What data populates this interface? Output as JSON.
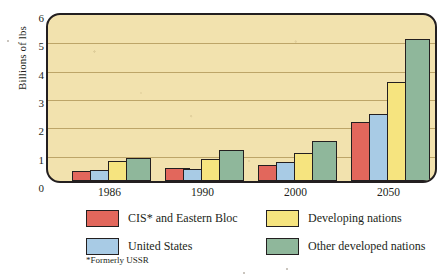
{
  "chart_data": {
    "type": "bar",
    "title": "",
    "xlabel": "",
    "ylabel": "Billions of lbs",
    "categories": [
      "1986",
      "1990",
      "2000",
      "2050"
    ],
    "ylim": [
      0,
      6
    ],
    "yticks": [
      "0",
      "1",
      "2",
      "3",
      "4",
      "5",
      "6"
    ],
    "grid": true,
    "legend_position": "below",
    "series": [
      {
        "name": "CIS* and Eastern Bloc",
        "color": "#e2675c",
        "values": [
          0.35,
          0.45,
          0.58,
          2.07
        ]
      },
      {
        "name": "United States",
        "color": "#a8cbe5",
        "values": [
          0.4,
          0.43,
          0.67,
          2.36
        ]
      },
      {
        "name": "Developing nations",
        "color": "#f6e47f",
        "values": [
          0.7,
          0.77,
          1.0,
          3.48
        ]
      },
      {
        "name": "Other developed nations",
        "color": "#8fb79b",
        "values": [
          0.8,
          1.1,
          1.42,
          5.0
        ]
      }
    ],
    "annotations": [
      "*Formerly USSR"
    ],
    "plot_background": "#f2e2ae",
    "gridline_color": "#b49a5c",
    "outline_color": "#231f20"
  },
  "axis": {
    "y_title": "Billions of lbs"
  },
  "legend": {
    "items": [
      {
        "label": "CIS* and Eastern Bloc",
        "color": "#e2675c"
      },
      {
        "label": "United States",
        "color": "#a8cbe5"
      },
      {
        "label": "Developing nations",
        "color": "#f6e47f"
      },
      {
        "label": "Other developed nations",
        "color": "#8fb79b"
      }
    ],
    "footnote": "*Formerly USSR"
  }
}
